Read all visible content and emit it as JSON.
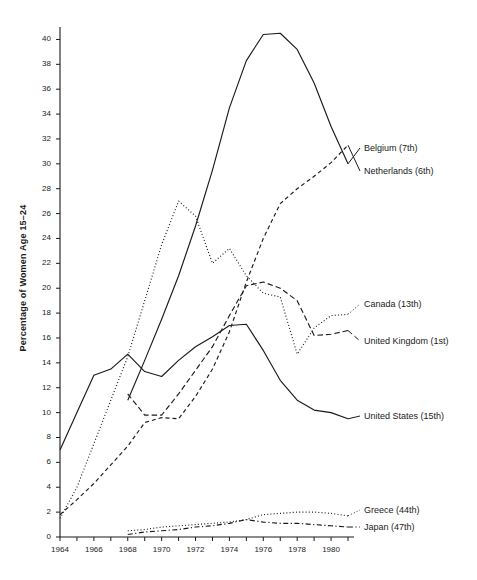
{
  "chart_data": {
    "type": "line",
    "title": "",
    "xlabel": "",
    "ylabel": "Percentage of Women Age 15–24",
    "xlim": [
      1964,
      1981
    ],
    "ylim": [
      0,
      41
    ],
    "ytick_step": 2,
    "xtick_step": 2,
    "grid": false,
    "legend_position": "right-inline",
    "x_ticks": [
      "1964",
      "1966",
      "1968",
      "1970",
      "1972",
      "1974",
      "1976",
      "1978",
      "1980"
    ],
    "y_ticks": [
      "0",
      "2",
      "4",
      "6",
      "8",
      "10",
      "12",
      "14",
      "16",
      "18",
      "20",
      "22",
      "24",
      "26",
      "28",
      "30",
      "32",
      "34",
      "36",
      "38",
      "40"
    ],
    "series": [
      {
        "name": "Belgium",
        "rank": "(7th)",
        "style": "solid",
        "label": "Belgium  (7th)",
        "x": [
          1968,
          1969,
          1970,
          1971,
          1972,
          1973,
          1974,
          1975,
          1976,
          1977,
          1978,
          1979,
          1980,
          1981
        ],
        "values": [
          11.0,
          14.2,
          17.5,
          21.0,
          25.0,
          29.5,
          34.5,
          38.3,
          40.4,
          40.5,
          39.2,
          36.5,
          33.0,
          30.0
        ]
      },
      {
        "name": "Netherlands",
        "rank": "(6th)",
        "style": "dashed",
        "label": "Netherlands  (6th)",
        "x": [
          1964,
          1965,
          1966,
          1967,
          1968,
          1969,
          1970,
          1971,
          1972,
          1973,
          1974,
          1975,
          1976,
          1977,
          1978,
          1979,
          1980,
          1981
        ],
        "values": [
          1.8,
          3.0,
          4.3,
          5.8,
          7.3,
          9.2,
          9.6,
          9.5,
          11.3,
          13.5,
          16.5,
          20.5,
          24.0,
          26.8,
          28.0,
          29.0,
          30.1,
          31.5
        ]
      },
      {
        "name": "Canada",
        "rank": "(13th)",
        "style": "dotted",
        "label": "Canada  (13th)",
        "x": [
          1964,
          1965,
          1966,
          1967,
          1968,
          1969,
          1970,
          1971,
          1972,
          1973,
          1974,
          1975,
          1976,
          1977,
          1978,
          1979,
          1980,
          1981
        ],
        "values": [
          1.5,
          4.0,
          7.5,
          11.0,
          14.5,
          19.0,
          23.5,
          27.0,
          25.8,
          22.0,
          23.2,
          21.0,
          19.6,
          19.3,
          14.7,
          16.8,
          17.8,
          17.9
        ]
      },
      {
        "name": "United Kingdom",
        "rank": "(1st)",
        "style": "dashed-long",
        "label": "United Kingdom  (1st)",
        "x": [
          1968,
          1969,
          1970,
          1971,
          1972,
          1973,
          1974,
          1975,
          1976,
          1977,
          1978,
          1979,
          1980,
          1981
        ],
        "values": [
          11.5,
          9.8,
          9.8,
          11.5,
          13.4,
          15.3,
          17.8,
          20.2,
          20.5,
          20.0,
          19.0,
          16.2,
          16.3,
          16.6
        ]
      },
      {
        "name": "United States",
        "rank": "(15th)",
        "style": "solid",
        "label": "United States  (15th)",
        "x": [
          1964,
          1965,
          1966,
          1967,
          1968,
          1969,
          1970,
          1971,
          1972,
          1973,
          1974,
          1975,
          1976,
          1977,
          1978,
          1979,
          1980,
          1981
        ],
        "values": [
          7.0,
          10.0,
          13.0,
          13.5,
          14.7,
          13.3,
          12.9,
          14.2,
          15.3,
          16.1,
          17.0,
          17.1,
          15.0,
          12.6,
          11.0,
          10.2,
          10.0,
          9.5
        ]
      },
      {
        "name": "Greece",
        "rank": "(44th)",
        "style": "dotted",
        "label": "Greece  (44th)",
        "x": [
          1968,
          1969,
          1970,
          1971,
          1972,
          1973,
          1974,
          1975,
          1976,
          1977,
          1978,
          1979,
          1980,
          1981
        ],
        "values": [
          0.5,
          0.6,
          0.8,
          0.9,
          1.0,
          1.1,
          1.2,
          1.4,
          1.8,
          1.9,
          2.0,
          2.0,
          1.9,
          1.7
        ]
      },
      {
        "name": "Japan",
        "rank": "(47th)",
        "style": "dash-dot",
        "label": "Japan  (47th)",
        "x": [
          1968,
          1969,
          1970,
          1971,
          1972,
          1973,
          1974,
          1975,
          1976,
          1977,
          1978,
          1979,
          1980,
          1981
        ],
        "values": [
          0.2,
          0.4,
          0.5,
          0.6,
          0.8,
          0.9,
          1.1,
          1.4,
          1.2,
          1.1,
          1.1,
          1.0,
          0.9,
          0.8
        ]
      }
    ]
  },
  "labels": {
    "belgium": "Belgium  (7th)",
    "netherlands": "Netherlands  (6th)",
    "canada": "Canada  (13th)",
    "united_kingdom": "United Kingdom  (1st)",
    "united_states": "United States  (15th)",
    "greece": "Greece  (44th)",
    "japan": "Japan  (47th)",
    "y_axis_title": "Percentage of Women Age 15–24"
  },
  "colors": {
    "line": "#1a1a1a",
    "axis": "#1a1a1a",
    "background": "#ffffff"
  }
}
